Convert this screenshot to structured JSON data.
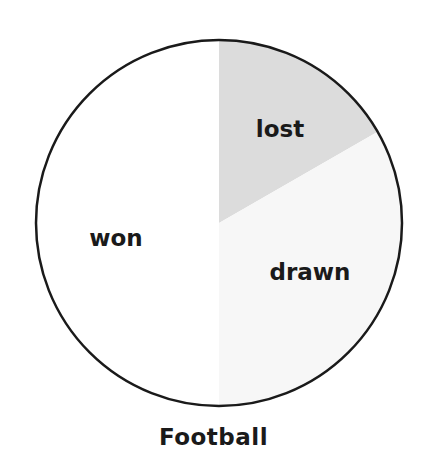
{
  "chart_data": {
    "type": "pie",
    "title": "Football",
    "categories": [
      "lost",
      "drawn",
      "won"
    ],
    "values": [
      16.7,
      33.3,
      50.0
    ],
    "colors": [
      "#dcdcdc",
      "#f7f7f7",
      "#ffffff"
    ],
    "start_angle_deg": 0,
    "direction": "clockwise",
    "outline_color": "#1a1a1a",
    "legend": "none",
    "labels_inside": true
  },
  "labels": {
    "lost": "lost",
    "drawn": "drawn",
    "won": "won"
  },
  "title": "Football"
}
